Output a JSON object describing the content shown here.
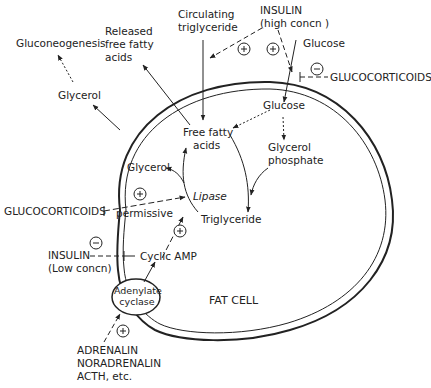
{
  "diagram": {
    "title": "FAT CELL",
    "colors": {
      "ink": "#222222",
      "background": "#ffffff"
    },
    "outside_labels": {
      "gluconeogenesis": "Gluconeogenesis",
      "glycerol_out": "Glycerol",
      "released_ffa": [
        "Released",
        "free fatty",
        "acids"
      ],
      "circulating_tg": [
        "Circulating",
        "triglyceride"
      ],
      "insulin_high": [
        "INSULIN",
        "(high concn )"
      ],
      "glucose_out": "Glucose",
      "glucocorticoids_top": "GLUCOCORTICOIDS",
      "glucocorticoids_left": "GLUCOCORTICOIDS",
      "permissive": "permissive",
      "insulin_low": [
        "INSULIN",
        "(Low concn)"
      ],
      "adrenalin": [
        "ADRENALIN",
        "NORADRENALIN",
        "ACTH, etc."
      ]
    },
    "inside_labels": {
      "glucose_in": "Glucose",
      "free_fatty_acids": [
        "Free fatty",
        "acids"
      ],
      "glycerol_in": "Glycerol",
      "glycerol_phosphate": [
        "Glycerol",
        "phosphate"
      ],
      "lipase": "Lipase",
      "triglyceride": "Triglyceride",
      "cyclic_amp": "Cyclic AMP",
      "adenylate_cyclase": [
        "Adenylate",
        "cyclase"
      ],
      "cell_label": "FAT CELL"
    },
    "signs": {
      "plus": "+",
      "minus": "−"
    },
    "regulators": [
      {
        "source": "INSULIN (high concn)",
        "effect": "+",
        "target": "Circulating triglyceride uptake"
      },
      {
        "source": "INSULIN (high concn)",
        "effect": "+",
        "target": "Glucose uptake"
      },
      {
        "source": "GLUCOCORTICOIDS",
        "effect": "−",
        "target": "Glucose uptake"
      },
      {
        "source": "GLUCOCORTICOIDS",
        "effect": "+ permissive",
        "target": "Lipase"
      },
      {
        "source": "INSULIN (Low concn)",
        "effect": "−",
        "target": "Cyclic AMP"
      },
      {
        "source": "Cyclic AMP",
        "effect": "+",
        "target": "Lipase"
      },
      {
        "source": "ADRENALIN, NORADRENALIN, ACTH, etc.",
        "effect": "+",
        "target": "Adenylate cyclase"
      }
    ]
  }
}
